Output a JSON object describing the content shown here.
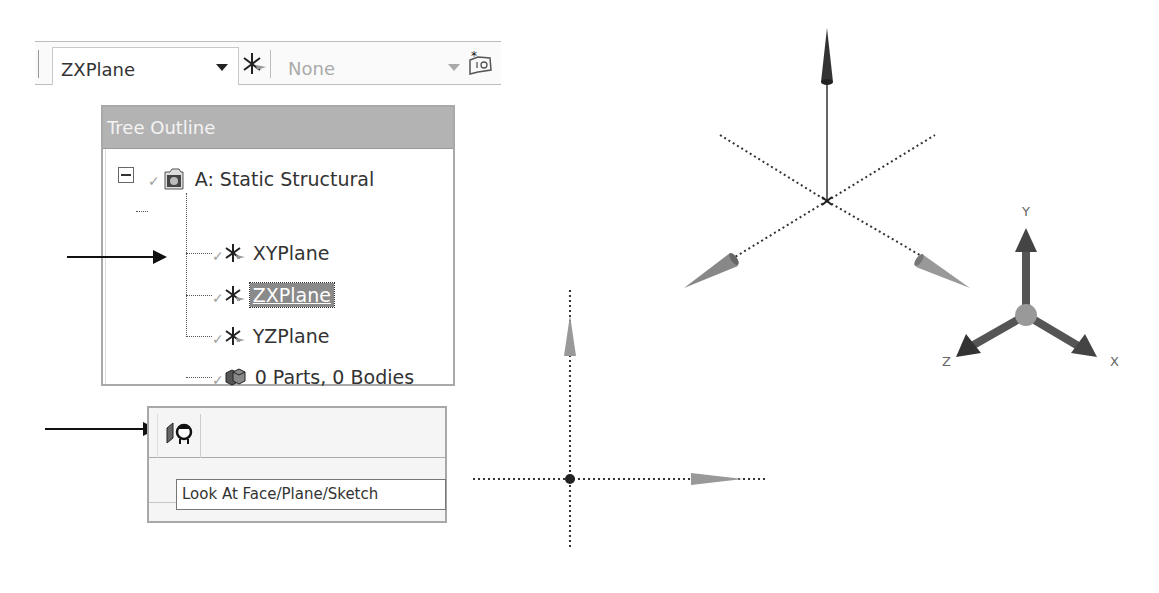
{
  "toolbar": {
    "plane_dropdown": {
      "selected": "ZXPlane"
    },
    "new_plane_icon": "plane-axes-icon",
    "sketch_dropdown": {
      "selected": "None",
      "enabled": false
    },
    "new_sketch_icon": "new-sketch-icon"
  },
  "tree_outline": {
    "title": "Tree Outline",
    "root": {
      "label": "A: Static Structural",
      "expanded": true,
      "icon": "model-icon"
    },
    "items": [
      {
        "label": "XYPlane",
        "icon": "plane-icon",
        "selected": false
      },
      {
        "label": "ZXPlane",
        "icon": "plane-icon",
        "selected": true
      },
      {
        "label": "YZPlane",
        "icon": "plane-icon",
        "selected": false
      },
      {
        "label": "0 Parts, 0 Bodies",
        "icon": "parts-bodies-icon",
        "selected": false
      }
    ]
  },
  "look_at_panel": {
    "button_icon": "look-at-icon",
    "tooltip": "Look At Face/Plane/Sketch"
  },
  "viewport_iso": {
    "description": "Isometric view of plane with normal arrow and two in-plane axes"
  },
  "viewport_normal": {
    "description": "Plane viewed normal-to with two in-plane axes"
  },
  "triad": {
    "labels": {
      "x": "X",
      "y": "Y",
      "z": "Z"
    }
  },
  "colors": {
    "selection_bg": "#8a8a8a",
    "header_bg": "#b3b3b3",
    "panel_border": "#a9a9a9"
  }
}
